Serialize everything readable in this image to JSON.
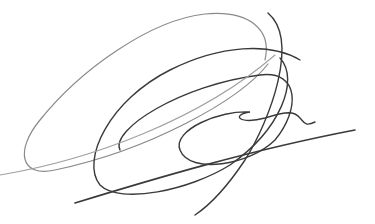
{
  "image": {
    "description": "Handwritten signature scribble",
    "background": "#ffffff",
    "ink_color": "#3a3a3a",
    "light_ink_color": "#9a9a9a"
  }
}
